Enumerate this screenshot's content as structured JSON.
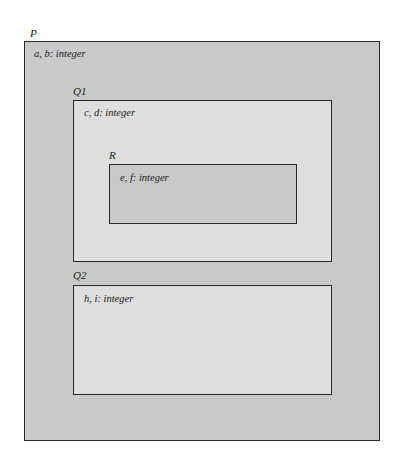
{
  "diagram": {
    "type": "nested-scope",
    "colors": {
      "outer_fill": "#c9c9c9",
      "inner_fill": "#dedede",
      "border": "#2a2a2a"
    },
    "scopes": [
      {
        "id": "P",
        "label": "P",
        "declaration": "a, b: integer"
      },
      {
        "id": "Q1",
        "label": "Q1",
        "parent": "P",
        "declaration": "c, d: integer"
      },
      {
        "id": "R",
        "label": "R",
        "parent": "Q1",
        "declaration": "e, f: integer"
      },
      {
        "id": "Q2",
        "label": "Q2",
        "parent": "P",
        "declaration": "h, i: integer"
      }
    ]
  }
}
